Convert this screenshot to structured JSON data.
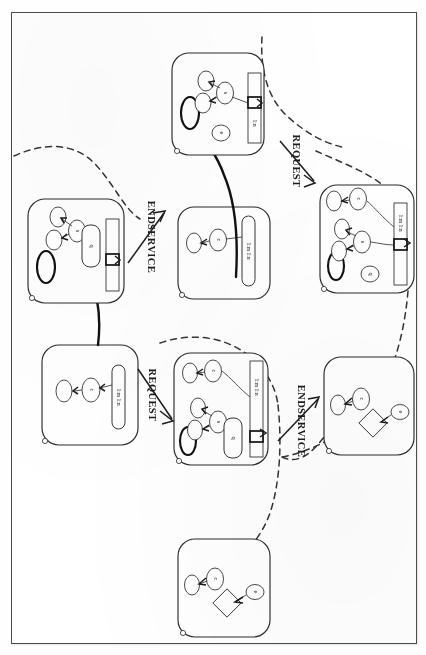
{
  "figure": {
    "title": "",
    "kind": "state-transition-diagram",
    "orientation_degrees": 90,
    "border": {
      "color": "#4a4a4a"
    },
    "transitions": [
      {
        "id": "t1",
        "label": "REQUEST",
        "from": "s0",
        "to": "s1"
      },
      {
        "id": "t2",
        "label": "ENDSERVICE",
        "from": "s1",
        "to": "s2"
      },
      {
        "id": "t3",
        "label": "REQUEST",
        "from": "s2",
        "to": "s3"
      },
      {
        "id": "t4",
        "label": "ENDSERVICE",
        "from": "s3",
        "to": "s4"
      }
    ],
    "states": [
      {
        "id": "s0",
        "name": "state-initial-left",
        "nodes": [
          {
            "label": "c",
            "shape": "ellipse"
          },
          {
            "label": "r",
            "shape": "ellipse"
          }
        ],
        "bar_label": "1:m 1:n",
        "has_queue_bar": true,
        "has_token": false,
        "has_diamond": false
      },
      {
        "id": "s1",
        "name": "state-request-left",
        "nodes": [
          {
            "label": "c",
            "shape": "ellipse"
          },
          {
            "label": "r",
            "shape": "ellipse"
          },
          {
            "label": "s",
            "shape": "ellipse"
          },
          {
            "label": "q",
            "shape": "ellipse"
          }
        ],
        "bar_label": "1:m 1:n",
        "has_queue_bar": true,
        "has_token": true,
        "has_diamond": false
      },
      {
        "id": "s2",
        "name": "state-mid-upper",
        "nodes": [
          {
            "label": "c",
            "shape": "ellipse"
          },
          {
            "label": "r",
            "shape": "ellipse"
          }
        ],
        "bar_label": "1:m 1:n",
        "has_queue_bar": true,
        "has_token": false,
        "has_diamond": false
      },
      {
        "id": "s3",
        "name": "state-endservice-upper",
        "nodes": [
          {
            "label": "c",
            "shape": "ellipse"
          },
          {
            "label": "r",
            "shape": "ellipse"
          },
          {
            "label": "s",
            "shape": "ellipse"
          }
        ],
        "bar_label": "1:n",
        "has_queue_bar": true,
        "has_token": true,
        "has_diamond": false
      },
      {
        "id": "s4",
        "name": "state-request-right",
        "nodes": [
          {
            "label": "c",
            "shape": "ellipse"
          },
          {
            "label": "r",
            "shape": "ellipse"
          },
          {
            "label": "s",
            "shape": "ellipse"
          },
          {
            "label": "q",
            "shape": "ellipse"
          }
        ],
        "bar_label": "1:m 1:n",
        "has_queue_bar": true,
        "has_token": true,
        "has_diamond": false
      },
      {
        "id": "s5",
        "name": "state-final-lower",
        "nodes": [
          {
            "label": "c",
            "shape": "ellipse"
          },
          {
            "label": "r",
            "shape": "ellipse"
          },
          {
            "label": "e",
            "shape": "ellipse"
          }
        ],
        "bar_label": "",
        "has_queue_bar": false,
        "has_token": false,
        "has_diamond": true
      },
      {
        "id": "s6",
        "name": "state-final-right",
        "nodes": [
          {
            "label": "c",
            "shape": "ellipse"
          },
          {
            "label": "r",
            "shape": "ellipse"
          },
          {
            "label": "e",
            "shape": "ellipse"
          }
        ],
        "bar_label": "",
        "has_queue_bar": false,
        "has_token": false,
        "has_diamond": true
      }
    ],
    "labels": {
      "request_1": "REQUEST",
      "request_2": "REQUEST",
      "endservice_1": "ENDSERVICE",
      "endservice_2": "ENDSERVICE",
      "node_c": "c",
      "node_r": "r",
      "node_s": "s",
      "node_q": "q",
      "node_e": "e",
      "bar_text_mn": "1:m 1:n",
      "bar_text_n": "1:n"
    }
  }
}
